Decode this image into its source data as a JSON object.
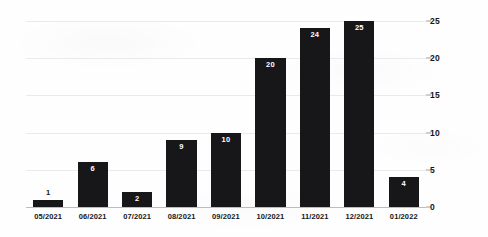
{
  "chart_data": {
    "type": "bar",
    "title": "",
    "subtitle": "",
    "xlabel": "",
    "ylabel": "",
    "categories": [
      "05/2021",
      "06/2021",
      "07/2021",
      "08/2021",
      "09/2021",
      "10/2021",
      "11/2021",
      "12/2021",
      "01/2022"
    ],
    "values": [
      1,
      6,
      2,
      9,
      10,
      20,
      24,
      25,
      4
    ],
    "value_labels": [
      "1",
      "6",
      "2",
      "9",
      "10",
      "20",
      "24",
      "25",
      "4"
    ],
    "ylim": [
      0,
      25
    ],
    "yticks": [
      0,
      5,
      10,
      15,
      20,
      25
    ],
    "ytick_labels": [
      "0",
      "5",
      "10",
      "15",
      "20",
      "25"
    ],
    "y_axis_position": "right",
    "grid": true,
    "grid_axis": "y",
    "legend": false,
    "bar_color": "#17171a",
    "grid_color": "#e9eaec",
    "axis_color": "#b9bcc0",
    "label_inside_color": "#ffffff",
    "label_outside_color": "#15161a"
  }
}
